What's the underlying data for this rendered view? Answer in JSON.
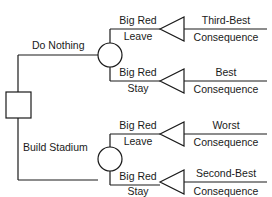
{
  "diagram": {
    "type": "decision-tree",
    "decision_node": {
      "shape": "square",
      "label": ""
    },
    "branches": [
      {
        "label": "Do Nothing",
        "chance_node": "circle",
        "outcomes": [
          {
            "event_line1": "Big Red",
            "event_line2": "Leave",
            "result": "Third-Best",
            "result_sub": "Consequence"
          },
          {
            "event_line1": "Big Red",
            "event_line2": "Stay",
            "result": "Best",
            "result_sub": "Consequence"
          }
        ]
      },
      {
        "label": "Build Stadium",
        "chance_node": "circle",
        "outcomes": [
          {
            "event_line1": "Big Red",
            "event_line2": "Leave",
            "result": "Worst",
            "result_sub": "Consequence"
          },
          {
            "event_line1": "Big Red",
            "event_line2": "Stay",
            "result": "Second-Best",
            "result_sub": "Consequence"
          }
        ]
      }
    ]
  }
}
